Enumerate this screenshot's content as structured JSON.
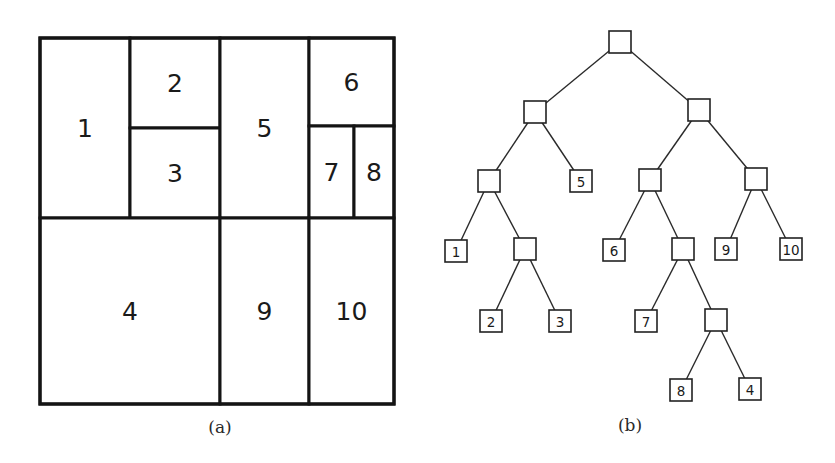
{
  "figure": {
    "panel_a": {
      "caption": "(a)",
      "outer_bounds": {
        "x0": 40,
        "y0": 38,
        "x1": 394,
        "y1": 404
      },
      "regions": [
        {
          "label": "1",
          "x0": 40,
          "y0": 38,
          "x1": 130,
          "y1": 218
        },
        {
          "label": "2",
          "x0": 130,
          "y0": 38,
          "x1": 220,
          "y1": 128
        },
        {
          "label": "3",
          "x0": 130,
          "y0": 128,
          "x1": 220,
          "y1": 218
        },
        {
          "label": "5",
          "x0": 220,
          "y0": 38,
          "x1": 309,
          "y1": 218
        },
        {
          "label": "6",
          "x0": 309,
          "y0": 38,
          "x1": 394,
          "y1": 126
        },
        {
          "label": "7",
          "x0": 309,
          "y0": 126,
          "x1": 354,
          "y1": 218
        },
        {
          "label": "8",
          "x0": 354,
          "y0": 126,
          "x1": 394,
          "y1": 218
        },
        {
          "label": "4",
          "x0": 40,
          "y0": 218,
          "x1": 220,
          "y1": 404
        },
        {
          "label": "9",
          "x0": 220,
          "y0": 218,
          "x1": 309,
          "y1": 404
        },
        {
          "label": "10",
          "x0": 309,
          "y0": 218,
          "x1": 394,
          "y1": 404
        }
      ]
    },
    "panel_b": {
      "caption": "(b)",
      "node_size": 22,
      "nodes": [
        {
          "id": "root",
          "label": "",
          "cx": 620,
          "cy": 42
        },
        {
          "id": "L",
          "label": "",
          "cx": 535,
          "cy": 112
        },
        {
          "id": "R",
          "label": "",
          "cx": 699,
          "cy": 110
        },
        {
          "id": "LL",
          "label": "",
          "cx": 489,
          "cy": 181
        },
        {
          "id": "leaf5",
          "label": "5",
          "cx": 581,
          "cy": 181
        },
        {
          "id": "RL",
          "label": "",
          "cx": 650,
          "cy": 180
        },
        {
          "id": "RR",
          "label": "",
          "cx": 756,
          "cy": 179
        },
        {
          "id": "leaf1",
          "label": "1",
          "cx": 456,
          "cy": 251
        },
        {
          "id": "LLR",
          "label": "",
          "cx": 525,
          "cy": 249
        },
        {
          "id": "leaf6",
          "label": "6",
          "cx": 614,
          "cy": 250
        },
        {
          "id": "RLR",
          "label": "",
          "cx": 683,
          "cy": 249
        },
        {
          "id": "leaf9",
          "label": "9",
          "cx": 726,
          "cy": 249
        },
        {
          "id": "leaf10",
          "label": "10",
          "cx": 791,
          "cy": 249
        },
        {
          "id": "leaf2",
          "label": "2",
          "cx": 491,
          "cy": 321
        },
        {
          "id": "leaf3",
          "label": "3",
          "cx": 560,
          "cy": 321
        },
        {
          "id": "leaf7",
          "label": "7",
          "cx": 646,
          "cy": 321
        },
        {
          "id": "RLRR",
          "label": "",
          "cx": 716,
          "cy": 320
        },
        {
          "id": "leaf8",
          "label": "8",
          "cx": 681,
          "cy": 390
        },
        {
          "id": "leaf4",
          "label": "4",
          "cx": 750,
          "cy": 389
        }
      ],
      "edges": [
        [
          "root",
          "L"
        ],
        [
          "root",
          "R"
        ],
        [
          "L",
          "LL"
        ],
        [
          "L",
          "leaf5"
        ],
        [
          "R",
          "RL"
        ],
        [
          "R",
          "RR"
        ],
        [
          "LL",
          "leaf1"
        ],
        [
          "LL",
          "LLR"
        ],
        [
          "LLR",
          "leaf2"
        ],
        [
          "LLR",
          "leaf3"
        ],
        [
          "RL",
          "leaf6"
        ],
        [
          "RL",
          "RLR"
        ],
        [
          "RLR",
          "leaf7"
        ],
        [
          "RLR",
          "RLRR"
        ],
        [
          "RLRR",
          "leaf8"
        ],
        [
          "RLRR",
          "leaf4"
        ],
        [
          "RR",
          "leaf9"
        ],
        [
          "RR",
          "leaf10"
        ]
      ]
    }
  }
}
